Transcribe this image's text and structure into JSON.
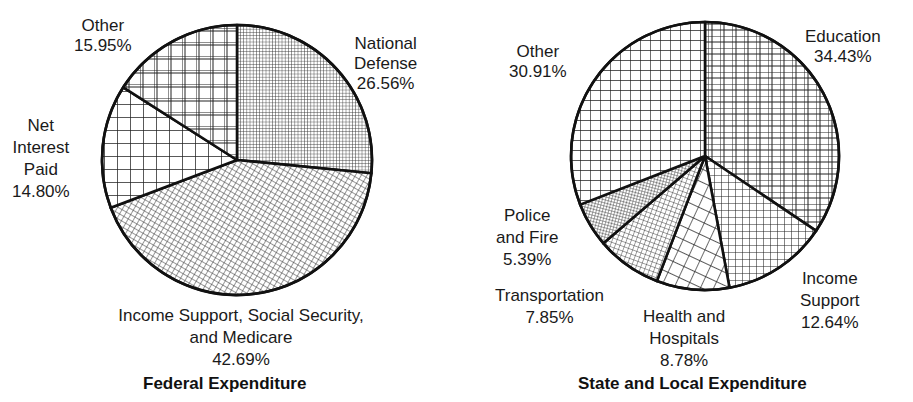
{
  "chart_data": [
    {
      "type": "pie",
      "title": "Federal Expenditure",
      "categories": [
        "National Defense",
        "Income Support, Social Security, and Medicare",
        "Net Interest Paid",
        "Other"
      ],
      "values": [
        26.56,
        42.69,
        14.8,
        15.95
      ],
      "unit": "%",
      "start_angle_deg": 0,
      "direction": "clockwise from 12 o'clock",
      "fill": "black-and-white hatch patterns",
      "labels": {
        "national_defense": [
          "National",
          "Defense",
          "26.56%"
        ],
        "income_support": [
          "Income Support, Social Security,",
          "and Medicare",
          "42.69%"
        ],
        "net_interest": [
          "Net",
          "Interest",
          "Paid",
          "14.80%"
        ],
        "other": [
          "Other",
          "15.95%"
        ]
      }
    },
    {
      "type": "pie",
      "title": "State and Local Expenditure",
      "categories": [
        "Education",
        "Income Support",
        "Health and Hospitals",
        "Transportation",
        "Police and Fire",
        "Other"
      ],
      "values": [
        34.43,
        12.64,
        8.78,
        7.85,
        5.39,
        30.91
      ],
      "unit": "%",
      "start_angle_deg": 0,
      "direction": "clockwise from 12 o'clock",
      "fill": "black-and-white hatch patterns",
      "labels": {
        "education": [
          "Education",
          "34.43%"
        ],
        "income_support": [
          "Income",
          "Support",
          "12.64%"
        ],
        "health": [
          "Health and",
          "Hospitals",
          "8.78%"
        ],
        "transportation": [
          "Transportation",
          "7.85%"
        ],
        "police_fire": [
          "Police",
          "and Fire",
          "5.39%"
        ],
        "other": [
          "Other",
          "30.91%"
        ]
      }
    }
  ]
}
